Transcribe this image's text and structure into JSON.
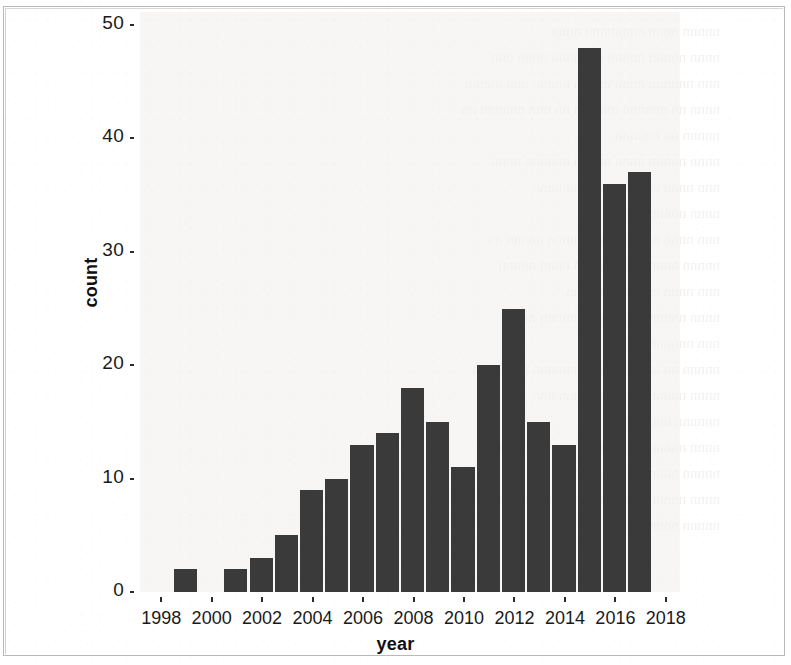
{
  "figure": {
    "background_color": "#ffffff",
    "panel_color": "#f2f1ef",
    "bar_color": "#3a3a3a",
    "axis_text_color": "#1a1a1a",
    "border_color": "#b9b9b9"
  },
  "chart_data": {
    "type": "bar",
    "title": "",
    "subtitle": "",
    "xlabel": "year",
    "ylabel": "count",
    "categories": [
      1999,
      2001,
      2002,
      2003,
      2004,
      2005,
      2006,
      2007,
      2008,
      2009,
      2010,
      2011,
      2012,
      2013,
      2014,
      2015,
      2016,
      2017
    ],
    "values": [
      2,
      2,
      3,
      5,
      9,
      10,
      13,
      14,
      18,
      15,
      11,
      20,
      25,
      15,
      13,
      48,
      36,
      37
    ],
    "points": [
      {
        "year": 1999,
        "count": 2
      },
      {
        "year": 2001,
        "count": 2
      },
      {
        "year": 2002,
        "count": 3
      },
      {
        "year": 2003,
        "count": 5
      },
      {
        "year": 2004,
        "count": 9
      },
      {
        "year": 2005,
        "count": 10
      },
      {
        "year": 2006,
        "count": 13
      },
      {
        "year": 2007,
        "count": 14
      },
      {
        "year": 2008,
        "count": 18
      },
      {
        "year": 2009,
        "count": 15
      },
      {
        "year": 2010,
        "count": 11
      },
      {
        "year": 2011,
        "count": 20
      },
      {
        "year": 2012,
        "count": 25
      },
      {
        "year": 2013,
        "count": 15
      },
      {
        "year": 2014,
        "count": 13
      },
      {
        "year": 2015,
        "count": 48
      },
      {
        "year": 2016,
        "count": 36
      },
      {
        "year": 2017,
        "count": 37
      }
    ],
    "missing_years": [
      1998,
      2000,
      2018
    ],
    "xlim": [
      1997.2,
      2018.6
    ],
    "ylim": [
      0,
      50
    ],
    "x_ticks": [
      1998,
      2000,
      2002,
      2004,
      2006,
      2008,
      2010,
      2012,
      2014,
      2016,
      2018
    ],
    "x_tick_labels": [
      "1998",
      "2000",
      "2002",
      "2004",
      "2006",
      "2008",
      "2010",
      "2012",
      "2014",
      "2016",
      "2018"
    ],
    "y_ticks": [
      0,
      10,
      20,
      30,
      40,
      50
    ],
    "y_tick_labels": [
      "0",
      "10",
      "20",
      "30",
      "40",
      "50"
    ],
    "grid": false,
    "legend": null,
    "legend_position": "none",
    "bar_width_years": 1,
    "annotations": []
  }
}
